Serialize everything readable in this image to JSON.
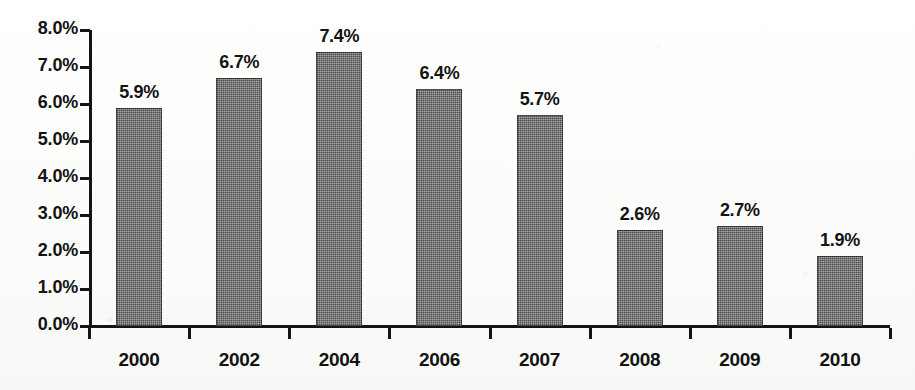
{
  "chart_data": {
    "type": "bar",
    "title": "",
    "subtitle": "",
    "xlabel": "",
    "ylabel": "",
    "categories": [
      "2000",
      "2002",
      "2004",
      "2006",
      "2007",
      "2008",
      "2009",
      "2010"
    ],
    "values": [
      5.9,
      6.7,
      7.4,
      6.4,
      5.7,
      2.6,
      2.7,
      1.9
    ],
    "data_labels": [
      "5.9%",
      "6.7%",
      "7.4%",
      "6.4%",
      "5.7%",
      "2.6%",
      "2.7%",
      "1.9%"
    ],
    "ylim": [
      0,
      8
    ],
    "ytick_values": [
      0,
      1,
      2,
      3,
      4,
      5,
      6,
      7,
      8
    ],
    "ytick_labels": [
      "0.0%",
      "1.0%",
      "2.0%",
      "3.0%",
      "4.0%",
      "5.0%",
      "6.0%",
      "7.0%",
      "8.0%"
    ],
    "grid": false,
    "legend": null,
    "series": [
      {
        "name": "",
        "values": [
          5.9,
          6.7,
          7.4,
          6.4,
          5.7,
          2.6,
          2.7,
          1.9
        ],
        "color": "#4a4a4a"
      }
    ],
    "annotations": [],
    "colors": {
      "bar_fill": "#4a4a4a",
      "axis": "#141414",
      "text": "#131313",
      "background": "#fdfdfc"
    }
  }
}
